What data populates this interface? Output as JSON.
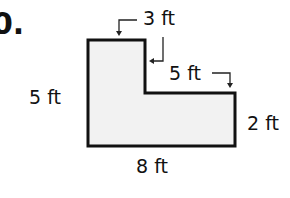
{
  "problem": {
    "number_fragment": "0."
  },
  "figure": {
    "shape": "L-shaped polygon",
    "fill_color": "#f2f2f2",
    "stroke_color": "#111111",
    "labels": {
      "top": "3 ft",
      "step": "5 ft",
      "left": "5 ft",
      "right": "2 ft",
      "bottom": "8 ft"
    }
  }
}
